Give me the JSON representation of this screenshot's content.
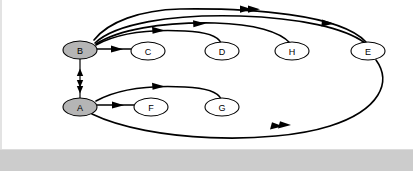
{
  "diagram": {
    "background_color": "#ffffff",
    "bottom_bar_color": "#cccccc",
    "edge_color": "#000000",
    "shaded_node_fill": "#b5b5b5",
    "plain_node_fill": "#ffffff",
    "nodes": [
      {
        "id": "B",
        "label": "B",
        "cx": 80,
        "cy": 50,
        "rx": 17,
        "ry": 9,
        "shaded": true
      },
      {
        "id": "A",
        "label": "A",
        "cx": 80,
        "cy": 107,
        "rx": 17,
        "ry": 9,
        "shaded": true
      },
      {
        "id": "C",
        "label": "C",
        "cx": 148,
        "cy": 51,
        "rx": 17,
        "ry": 9,
        "shaded": false
      },
      {
        "id": "D",
        "label": "D",
        "cx": 222,
        "cy": 51,
        "rx": 17,
        "ry": 9,
        "shaded": false
      },
      {
        "id": "H",
        "label": "H",
        "cx": 292,
        "cy": 51,
        "rx": 17,
        "ry": 9,
        "shaded": false
      },
      {
        "id": "E",
        "label": "E",
        "cx": 368,
        "cy": 51,
        "rx": 17,
        "ry": 9,
        "shaded": false
      },
      {
        "id": "F",
        "label": "F",
        "cx": 151,
        "cy": 107,
        "rx": 17,
        "ry": 9,
        "shaded": false
      },
      {
        "id": "G",
        "label": "G",
        "cx": 222,
        "cy": 107,
        "rx": 17,
        "ry": 9,
        "shaded": false
      }
    ],
    "edges": [
      {
        "id": "b-c",
        "from": "B",
        "to": "C",
        "arrow": "single",
        "direction": "forward"
      },
      {
        "id": "b-d",
        "from": "B",
        "to": "D",
        "arrow": "single",
        "direction": "forward"
      },
      {
        "id": "b-h",
        "from": "B",
        "to": "H",
        "arrow": "single",
        "direction": "forward"
      },
      {
        "id": "b-e",
        "from": "B",
        "to": "E",
        "arrow": "single",
        "direction": "forward"
      },
      {
        "id": "e-b",
        "from": "E",
        "to": "B",
        "arrow": "double",
        "direction": "backward"
      },
      {
        "id": "a-f",
        "from": "A",
        "to": "F",
        "arrow": "single",
        "direction": "forward"
      },
      {
        "id": "a-g",
        "from": "A",
        "to": "G",
        "arrow": "single",
        "direction": "forward"
      },
      {
        "id": "e-a",
        "from": "E",
        "to": "A",
        "arrow": "double",
        "direction": "backward"
      },
      {
        "id": "a-b",
        "from": "A",
        "to": "B",
        "arrow": "single",
        "direction": "forward"
      },
      {
        "id": "b-a",
        "from": "B",
        "to": "A",
        "arrow": "double",
        "direction": "forward"
      }
    ]
  }
}
